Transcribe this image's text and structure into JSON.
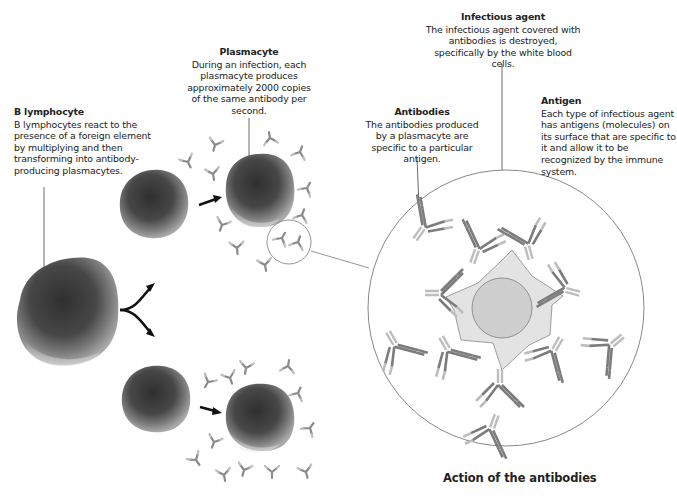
{
  "diagram": {
    "caption": "Action of the antibodies",
    "labels": {
      "b_lymphocyte": {
        "title": "B lymphocyte",
        "text": "B lymphocytes react to the presence of a foreign element by multiplying and then transforming into antibody-producing plasmacytes."
      },
      "plasmacyte": {
        "title": "Plasmacyte",
        "text": "During an infection, each plasmacyte produces approximately 2000 copies of the same antibody per second."
      },
      "infectious_agent": {
        "title": "Infectious agent",
        "text": "The infectious agent covered with antibodies is destroyed, specifically by the white blood cells."
      },
      "antibodies": {
        "title": "Antibodies",
        "text": "The antibodies produced by a plasmacyte are specific to a particular antigen."
      },
      "antigen": {
        "title": "Antigen",
        "text": "Each type of infectious agent has antigens (molecules) on its surface that are specific to it and allow it to be recognized by the immune system."
      }
    },
    "colors": {
      "cell_dark": "#3a3a3a",
      "cell_mid": "#6e6e6e",
      "cell_light": "#b8b8b8",
      "antibody": "#8a8a8a",
      "antibody_light": "#b5b5b5",
      "agent_fill": "#cfcfcf",
      "antigen_fill": "#e2e2e2",
      "outline": "#888888",
      "text": "#222222"
    }
  }
}
